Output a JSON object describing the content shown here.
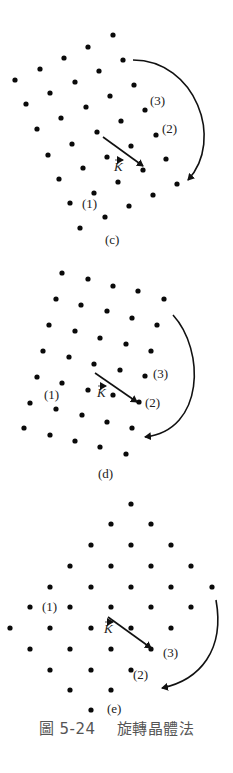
{
  "figure": {
    "caption_number": "圖 5-24",
    "caption_title": "旋轉晶體法",
    "vector_label": "K",
    "panels": [
      {
        "id": "c",
        "label": "(c)",
        "label_pos": [
          105,
          244
        ],
        "annotations": [
          {
            "text": "(3)",
            "x": 150,
            "y": 105
          },
          {
            "text": "(2)",
            "x": 162,
            "y": 133
          },
          {
            "text": "(1)",
            "x": 82,
            "y": 208
          }
        ],
        "k_label_pos": [
          114,
          171
        ],
        "k_vector": {
          "from": [
            103,
            137
          ],
          "to": [
            143,
            166
          ]
        },
        "rotation_arc": {
          "start": [
            133,
            60
          ],
          "c1": [
            195,
            60
          ],
          "c2": [
            225,
            140
          ],
          "end": [
            188,
            180
          ]
        },
        "dots": [
          [
            113,
            35
          ],
          [
            88,
            47
          ],
          [
            64,
            58
          ],
          [
            40,
            69
          ],
          [
            15,
            80
          ],
          [
            123,
            60
          ],
          [
            99,
            71
          ],
          [
            75,
            82
          ],
          [
            50,
            93
          ],
          [
            26,
            104
          ],
          [
            134,
            85
          ],
          [
            110,
            96
          ],
          [
            86,
            107
          ],
          [
            61,
            118
          ],
          [
            37,
            129
          ],
          [
            145,
            110
          ],
          [
            121,
            121
          ],
          [
            97,
            132
          ],
          [
            72,
            144
          ],
          [
            48,
            155
          ],
          [
            156,
            135
          ],
          [
            131,
            146
          ],
          [
            107,
            157
          ],
          [
            83,
            168
          ],
          [
            59,
            179
          ],
          [
            166,
            159
          ],
          [
            143,
            170
          ],
          [
            118,
            182
          ],
          [
            94,
            193
          ],
          [
            70,
            203
          ],
          [
            177,
            184
          ],
          [
            153,
            195
          ],
          [
            129,
            206
          ],
          [
            105,
            217
          ],
          [
            80,
            228
          ]
        ]
      },
      {
        "id": "d",
        "label": "(d)",
        "label_pos": [
          98,
          478
        ],
        "annotations": [
          {
            "text": "(3)",
            "x": 153,
            "y": 378
          },
          {
            "text": "(2)",
            "x": 145,
            "y": 407
          },
          {
            "text": "(1)",
            "x": 44,
            "y": 399
          }
        ],
        "k_label_pos": [
          97,
          397
        ],
        "k_vector": {
          "from": [
            95,
            373
          ],
          "to": [
            137,
            402
          ]
        },
        "rotation_arc": {
          "start": [
            173,
            315
          ],
          "c1": [
            205,
            350
          ],
          "c2": [
            205,
            430
          ],
          "end": [
            145,
            437
          ]
        },
        "dots": [
          [
            62,
            273
          ],
          [
            88,
            279
          ],
          [
            113,
            286
          ],
          [
            138,
            291
          ],
          [
            164,
            299
          ],
          [
            56,
            299
          ],
          [
            81,
            305
          ],
          [
            107,
            311
          ],
          [
            132,
            318
          ],
          [
            157,
            325
          ],
          [
            49,
            325
          ],
          [
            75,
            331
          ],
          [
            100,
            338
          ],
          [
            126,
            344
          ],
          [
            151,
            351
          ],
          [
            43,
            351
          ],
          [
            69,
            357
          ],
          [
            94,
            364
          ],
          [
            120,
            370
          ],
          [
            145,
            376
          ],
          [
            37,
            377
          ],
          [
            62,
            383
          ],
          [
            88,
            390
          ],
          [
            113,
            395
          ],
          [
            139,
            402
          ],
          [
            30,
            403
          ],
          [
            56,
            409
          ],
          [
            82,
            415
          ],
          [
            107,
            422
          ],
          [
            132,
            428
          ],
          [
            24,
            428
          ],
          [
            50,
            435
          ],
          [
            75,
            441
          ],
          [
            100,
            447
          ],
          [
            126,
            454
          ]
        ]
      },
      {
        "id": "e",
        "label": "(e)",
        "label_pos": [
          107,
          713
        ],
        "annotations": [
          {
            "text": "(1)",
            "x": 42,
            "y": 611
          },
          {
            "text": "(3)",
            "x": 163,
            "y": 657
          },
          {
            "text": "(2)",
            "x": 133,
            "y": 679
          }
        ],
        "k_label_pos": [
          104,
          633
        ],
        "k_vector": {
          "from": [
            108,
            617
          ],
          "to": [
            151,
            648
          ]
        },
        "rotation_arc": {
          "start": [
            216,
            600
          ],
          "c1": [
            225,
            650
          ],
          "c2": [
            200,
            680
          ],
          "end": [
            162,
            688
          ]
        },
        "dots": [
          [
            131,
            504
          ],
          [
            111,
            524
          ],
          [
            151,
            524
          ],
          [
            91,
            545
          ],
          [
            131,
            545
          ],
          [
            171,
            545
          ],
          [
            70,
            566
          ],
          [
            111,
            566
          ],
          [
            151,
            566
          ],
          [
            191,
            566
          ],
          [
            50,
            587
          ],
          [
            91,
            587
          ],
          [
            131,
            587
          ],
          [
            171,
            587
          ],
          [
            212,
            587
          ],
          [
            30,
            607
          ],
          [
            70,
            607
          ],
          [
            111,
            607
          ],
          [
            151,
            607
          ],
          [
            191,
            607
          ],
          [
            10,
            628
          ],
          [
            50,
            628
          ],
          [
            91,
            628
          ],
          [
            131,
            628
          ],
          [
            171,
            628
          ],
          [
            30,
            649
          ],
          [
            70,
            649
          ],
          [
            111,
            649
          ],
          [
            151,
            649
          ],
          [
            50,
            670
          ],
          [
            91,
            670
          ],
          [
            131,
            670
          ],
          [
            70,
            690
          ],
          [
            111,
            690
          ],
          [
            91,
            710
          ]
        ]
      }
    ]
  }
}
